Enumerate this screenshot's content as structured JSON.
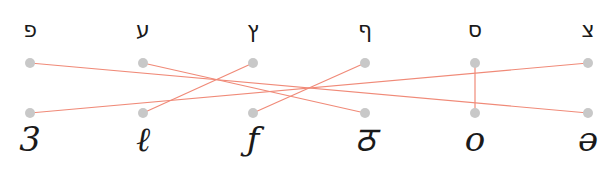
{
  "diagram": {
    "type": "matching",
    "colors": {
      "line": "#f08a78",
      "dot": "#c8c8c8",
      "text": "#1a1a1a"
    },
    "top_row": {
      "y": 63,
      "items": [
        {
          "label": "פ",
          "x": 30
        },
        {
          "label": "ע",
          "x": 143
        },
        {
          "label": "ץ",
          "x": 253
        },
        {
          "label": "ף",
          "x": 365
        },
        {
          "label": "ס",
          "x": 475
        },
        {
          "label": "צ",
          "x": 588
        }
      ]
    },
    "bottom_row": {
      "y": 113,
      "items": [
        {
          "label": "3",
          "x": 30
        },
        {
          "label": "ℓ",
          "x": 143
        },
        {
          "label": "ƒ",
          "x": 253
        },
        {
          "label": "ठ",
          "x": 365
        },
        {
          "label": "o",
          "x": 475
        },
        {
          "label": "ə",
          "x": 588
        }
      ]
    },
    "connections": [
      {
        "from": 0,
        "to": 5
      },
      {
        "from": 1,
        "to": 3
      },
      {
        "from": 2,
        "to": 1
      },
      {
        "from": 3,
        "to": 2
      },
      {
        "from": 4,
        "to": 4
      },
      {
        "from": 5,
        "to": 0
      }
    ]
  }
}
